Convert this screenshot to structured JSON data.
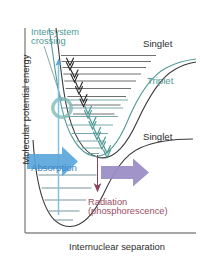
{
  "figure": {
    "type": "energy-level-diagram",
    "background": "#ffffff"
  },
  "axes": {
    "y_label": "Molecular potential energy",
    "x_label": "Internuclear separation",
    "axis_color": "#8a8a8a",
    "label_color": "#2d2d2d"
  },
  "labels": {
    "intersystem_crossing": "Intersystem\ncrossing",
    "intersystem_crossing_line1": "Intersystem",
    "intersystem_crossing_line2": "crossing",
    "singlet_excited": "Singlet",
    "triplet": "Triplet",
    "singlet_ground": "Singlet",
    "absorption": "Absorption",
    "radiation_line1": "Radiation",
    "radiation_line2": "(phosphorescence)"
  },
  "colors": {
    "teal": "#4f9a96",
    "teal_light": "#6fb3ae",
    "dark_gray": "#404040",
    "curve_black": "#3a3a3a",
    "blue_arrow": "#5aa7dc",
    "blue_text": "#3c82c4",
    "purple_arrow": "#9a8cc4",
    "maroon": "#9b4d63",
    "maroon_arrow": "#8e4458",
    "axis": "#8a8a8a",
    "isc_circle": "#7fb9b4"
  },
  "curves": [
    {
      "name": "singlet-excited-well",
      "state": "Singlet",
      "color": "#3a3a3a",
      "vibrational_levels": 9,
      "description": "Upper singlet potential well, minimum left of center, dissociation plateau at top right"
    },
    {
      "name": "triplet-well",
      "state": "Triplet",
      "color": "#4f9a96",
      "vibrational_levels": 8,
      "description": "Triplet potential well nested inside and below the excited singlet, crossing it on the left limb"
    },
    {
      "name": "singlet-ground-well",
      "state": "Singlet",
      "color": "#3a3a3a",
      "vibrational_levels": 5,
      "description": "Ground-state singlet well at bottom left with dissociation plateau to the right"
    }
  ],
  "arrows": [
    {
      "name": "absorption-arrow",
      "label": "Absorption",
      "color": "#5aa7dc",
      "direction": "right",
      "kind": "block-arrow"
    },
    {
      "name": "excitation-arrow",
      "color": "#5aa7dc",
      "direction": "up",
      "kind": "thin-vertical"
    },
    {
      "name": "vibrational-relaxation-singlet",
      "color": "#303030",
      "direction": "down",
      "kind": "chevron-cascade",
      "count": 4
    },
    {
      "name": "vibrational-relaxation-triplet",
      "color": "#4f9a96",
      "direction": "down",
      "kind": "chevron-cascade",
      "count": 5
    },
    {
      "name": "phosphorescence-arrow",
      "color": "#8e4458",
      "direction": "down",
      "kind": "thin-vertical"
    },
    {
      "name": "emission-arrow",
      "label": "Radiation (phosphorescence)",
      "color": "#9a8cc4",
      "direction": "right",
      "kind": "block-arrow"
    }
  ],
  "markers": [
    {
      "name": "intersystem-crossing-circle",
      "color": "#7fb9b4",
      "shape": "ring",
      "description": "Highlight ring at the singlet/triplet curve crossing point"
    }
  ]
}
